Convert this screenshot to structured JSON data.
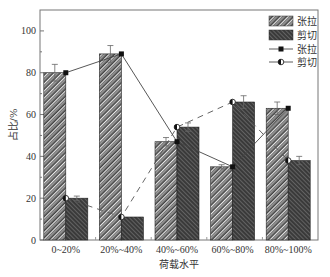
{
  "chart_data": {
    "type": "bar",
    "title": "",
    "xlabel": "荷载水平",
    "ylabel": "占比/%",
    "ylim": [
      0,
      110
    ],
    "yticks": [
      0,
      20,
      40,
      60,
      80,
      100
    ],
    "ytick_labels": [
      "0",
      "20",
      "40",
      "60",
      "80",
      "100"
    ],
    "categories": [
      "0~20%",
      "20%~40%",
      "40%~60%",
      "60%~80%",
      "80%~100%"
    ],
    "grid": false,
    "legend_position": "top-right",
    "series": [
      {
        "name": "张拉",
        "kind": "bar",
        "pattern": "diagonal-light",
        "values": [
          80,
          89,
          47,
          35,
          63
        ],
        "errors": [
          4,
          4,
          2,
          1,
          3
        ]
      },
      {
        "name": "剪切",
        "kind": "bar",
        "pattern": "diagonal-dark",
        "values": [
          20,
          11,
          54,
          66,
          38
        ],
        "errors": [
          1,
          0,
          2,
          3,
          2
        ]
      },
      {
        "name": "张拉",
        "kind": "line",
        "line_style": "solid",
        "marker": "square",
        "values": [
          80,
          89,
          47,
          35,
          63
        ]
      },
      {
        "name": "剪切",
        "kind": "line",
        "line_style": "dashed",
        "marker": "half-filled-circle",
        "values": [
          20,
          11,
          54,
          66,
          38
        ]
      }
    ],
    "legend": [
      {
        "label": "张拉",
        "kind": "bar-light"
      },
      {
        "label": "剪切",
        "kind": "bar-dark"
      },
      {
        "label": "张拉",
        "kind": "line-square"
      },
      {
        "label": "剪切",
        "kind": "line-circle"
      }
    ]
  }
}
